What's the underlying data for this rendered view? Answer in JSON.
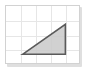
{
  "canvas": {
    "width": 86,
    "height": 71,
    "background": "#ffffff"
  },
  "panel": {
    "name": "grid-panel",
    "background": "#ffffff",
    "border_color": "#d2d2d2",
    "shadow_color": "#d9d9d9",
    "left": 5,
    "top": 5,
    "width": 75,
    "height": 59
  },
  "grid": {
    "line_color": "#e6e6e6",
    "columns": 5,
    "rows": 4,
    "cell_width": 15,
    "cell_height": 14.75,
    "vertical_lines": [
      15,
      30,
      45,
      60
    ],
    "horizontal_lines": [
      14.75,
      29.5,
      44.25
    ]
  },
  "figure": {
    "name": "right-triangle",
    "shape": "triangle",
    "fill": "#c9c9c9",
    "fill_opacity": 0.85,
    "stroke": "#5a5a5a",
    "stroke_width": 1.6,
    "right_angle_vertex": "bottom-right",
    "vertices": [
      {
        "label": "left",
        "x": 17,
        "y": 50
      },
      {
        "label": "apex",
        "x": 61,
        "y": 19
      },
      {
        "label": "right-angle",
        "x": 61,
        "y": 50
      }
    ],
    "base_length_cells": 3,
    "height_cells": 2
  }
}
